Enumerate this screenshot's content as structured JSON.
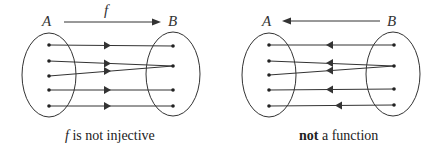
{
  "colors": {
    "stroke": "#333333",
    "background": "#ffffff"
  },
  "panels": [
    {
      "id": "injective",
      "set_a_label": "A",
      "set_b_label": "B",
      "map_label": "f",
      "map_direction": "A-to-B",
      "caption_prefix": "f",
      "caption_rest": " is not injective",
      "edges": [
        {
          "from": "A1",
          "to": "B1"
        },
        {
          "from": "A2",
          "to": "B2"
        },
        {
          "from": "A3",
          "to": "B2"
        },
        {
          "from": "A4",
          "to": "B3"
        },
        {
          "from": "A5",
          "to": "B4"
        }
      ]
    },
    {
      "id": "not-function",
      "set_a_label": "A",
      "set_b_label": "B",
      "map_label": "",
      "map_direction": "B-to-A",
      "caption_bold": "not",
      "caption_rest": " a function",
      "edges": [
        {
          "from": "B1",
          "to": "A1"
        },
        {
          "from": "B2",
          "to": "A2"
        },
        {
          "from": "B2",
          "to": "A3"
        },
        {
          "from": "B3",
          "to": "A4"
        },
        {
          "from": "B4",
          "to": "A5"
        }
      ]
    }
  ]
}
